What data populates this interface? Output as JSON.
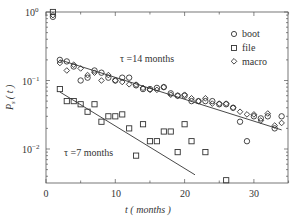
{
  "chart_data": {
    "type": "scatter",
    "title": "",
    "xlabel": "t ( months )",
    "ylabel": "P_s(t)",
    "xlim": [
      0,
      35
    ],
    "ylim": [
      0.003,
      1
    ],
    "yscale": "log",
    "x_ticks": [
      0,
      10,
      20,
      30
    ],
    "y_ticks": [
      {
        "value": 1,
        "label": "10^0"
      },
      {
        "value": 0.1,
        "label": "10^-1"
      },
      {
        "value": 0.01,
        "label": "10^-2"
      }
    ],
    "grid": false,
    "legend_position": "upper right",
    "series": [
      {
        "name": "boot",
        "marker": "circle",
        "x": [
          1,
          2,
          3,
          4,
          5,
          6,
          7,
          8,
          9,
          10,
          11,
          12,
          13,
          14,
          15,
          16,
          17,
          18,
          19,
          20,
          21,
          22,
          23,
          24,
          25,
          26,
          27,
          28,
          29,
          30,
          31,
          32,
          33,
          34
        ],
        "y": [
          0.85,
          0.2,
          0.19,
          0.16,
          0.1,
          0.11,
          0.14,
          0.13,
          0.11,
          0.1,
          0.11,
          0.11,
          0.085,
          0.075,
          0.075,
          0.078,
          0.08,
          0.065,
          0.06,
          0.06,
          0.05,
          0.05,
          0.05,
          0.05,
          0.045,
          0.045,
          0.04,
          0.025,
          0.013,
          0.03,
          0.028,
          0.03,
          0.02,
          0.03
        ]
      },
      {
        "name": "file",
        "marker": "square",
        "x": [
          1,
          2,
          3,
          4,
          5,
          6,
          7,
          8,
          9,
          10,
          11,
          12,
          13,
          14,
          15,
          16,
          17,
          18,
          19,
          20,
          21,
          23,
          26
        ],
        "y": [
          1.0,
          0.075,
          0.05,
          0.05,
          0.045,
          0.035,
          0.045,
          0.025,
          0.03,
          0.03,
          0.032,
          0.02,
          0.008,
          0.023,
          0.013,
          0.013,
          0.018,
          0.018,
          0.009,
          0.023,
          0.013,
          0.009,
          0.0035
        ]
      },
      {
        "name": "macro",
        "marker": "diamond",
        "x": [
          1,
          2,
          3,
          4,
          5,
          6,
          7,
          8,
          9,
          10,
          11,
          12,
          13,
          14,
          15,
          16,
          17,
          18,
          19,
          20,
          21,
          22,
          23,
          24,
          25,
          26,
          27,
          28,
          29,
          30,
          31,
          32,
          33,
          34
        ],
        "y": [
          0.9,
          0.18,
          0.14,
          0.17,
          0.15,
          0.12,
          0.13,
          0.1,
          0.12,
          0.1,
          0.095,
          0.088,
          0.087,
          0.078,
          0.073,
          0.073,
          0.08,
          0.062,
          0.06,
          0.062,
          0.055,
          0.05,
          0.055,
          0.046,
          0.046,
          0.046,
          0.04,
          0.035,
          0.032,
          0.032,
          0.026,
          0.033,
          0.022,
          0.024
        ]
      }
    ],
    "fit_lines": [
      {
        "name": "tau_14",
        "x": [
          2,
          34
        ],
        "y": [
          0.2,
          0.019
        ],
        "label": "τ =14 months"
      },
      {
        "name": "tau_7",
        "x": [
          2,
          21.5
        ],
        "y": [
          0.068,
          0.0042
        ],
        "label": "τ =7 months"
      }
    ],
    "annotations": [
      {
        "text": "τ =14 months",
        "x": 11,
        "y": 0.16
      },
      {
        "text": "τ =7 months",
        "x": 3,
        "y": 0.011
      }
    ]
  },
  "labels": {
    "xlabel": "t ( months )",
    "ylabel_main": "P",
    "ylabel_sub": "s",
    "ylabel_arg": "( t )",
    "annot_tau14": "τ =14 months",
    "annot_tau7": "τ =7 months",
    "legend": [
      "boot",
      "file",
      "macro"
    ],
    "xticks": [
      "0",
      "10",
      "20",
      "30"
    ],
    "yticks_base": [
      "10",
      "10",
      "10"
    ],
    "yticks_exp": [
      "0",
      "−1",
      "−2"
    ]
  }
}
